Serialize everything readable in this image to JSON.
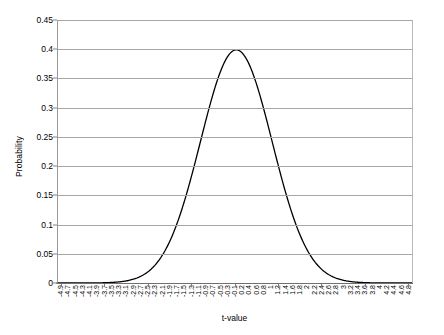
{
  "chart_data": {
    "type": "line",
    "title": "",
    "xlabel": "t-value",
    "ylabel": "Probability",
    "xlim": [
      -5.0,
      4.9
    ],
    "ylim": [
      0,
      0.45
    ],
    "grid": true,
    "legend": false,
    "legend_position": "none",
    "line_color": "#000000",
    "grid_color": "#a6a6a6",
    "background_color": "#ffffff",
    "y_ticks": [
      0,
      0.05,
      0.1,
      0.15,
      0.2,
      0.25,
      0.3,
      0.35,
      0.4,
      0.45
    ],
    "y_tick_labels": [
      "0",
      "0.05",
      "0.1",
      "0.15",
      "0.2",
      "0.25",
      "0.3",
      "0.35",
      "0.4",
      "0.45"
    ],
    "x_tick_labels": [
      "-4.9",
      "-4.7",
      "-4.5",
      "-4.3",
      "-4.1",
      "-3.9",
      "-3.7",
      "-3.5",
      "-3.3",
      "-3.1",
      "-2.9",
      "-2.7",
      "-2.5",
      "-2.3",
      "-2.1",
      "-1.9",
      "-1.7",
      "-1.5",
      "-1.3",
      "-1.1",
      "-0.9",
      "-0.7",
      "-0.5",
      "-0.3",
      "-0.1",
      "0.2",
      "0.4",
      "0.6",
      "0.8",
      "1",
      "1.2",
      "1.4",
      "1.6",
      "1.8",
      "2",
      "2.2",
      "2.4",
      "2.6",
      "2.8",
      "3",
      "3.2",
      "3.4",
      "3.6",
      "3.8",
      "4",
      "4.2",
      "4.4",
      "4.6",
      "4.8"
    ],
    "x": [
      -4.9,
      -4.7,
      -4.5,
      -4.3,
      -4.1,
      -3.9,
      -3.7,
      -3.5,
      -3.3,
      -3.1,
      -2.9,
      -2.7,
      -2.5,
      -2.3,
      -2.1,
      -1.9,
      -1.7,
      -1.5,
      -1.3,
      -1.1,
      -0.9,
      -0.7,
      -0.5,
      -0.3,
      -0.1,
      0.2,
      0.4,
      0.6,
      0.8,
      1,
      1.2,
      1.4,
      1.6,
      1.8,
      2,
      2.2,
      2.4,
      2.6,
      2.8,
      3,
      3.2,
      3.4,
      3.6,
      3.8,
      4,
      4.2,
      4.4,
      4.6,
      4.8
    ],
    "values": [
      0.0,
      0.0,
      0.0,
      0.0001,
      0.0001,
      0.0002,
      0.0004,
      0.0009,
      0.0017,
      0.0033,
      0.006,
      0.0104,
      0.0175,
      0.0283,
      0.044,
      0.0656,
      0.094,
      0.1295,
      0.1714,
      0.2179,
      0.2661,
      0.3123,
      0.3521,
      0.3814,
      0.397,
      0.391,
      0.3683,
      0.3332,
      0.2897,
      0.242,
      0.1942,
      0.1497,
      0.1109,
      0.079,
      0.054,
      0.0355,
      0.0224,
      0.0136,
      0.0079,
      0.0044,
      0.0024,
      0.0012,
      0.0006,
      0.0003,
      0.0001,
      0.0001,
      0.0,
      0.0,
      0.0
    ],
    "peak": {
      "x": 0,
      "y": 0.3989
    },
    "series_name": "Probability density"
  }
}
